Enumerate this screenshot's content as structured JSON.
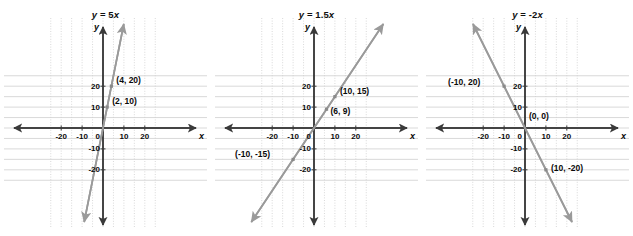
{
  "figure": {
    "title": "",
    "panel_count": 3,
    "axis_names": {
      "x": "x",
      "y": "y"
    },
    "xticks": [
      -20,
      -10,
      0,
      10,
      20
    ],
    "yticks": [
      20,
      10,
      0,
      -10,
      -20
    ],
    "xtick_labels": [
      "-20",
      "-10",
      "0",
      "10",
      "20"
    ],
    "ytick_labels": [
      "20",
      "10",
      "-10",
      "-20"
    ],
    "origin_label": "0",
    "grid_step": 5,
    "grid_color": "#cfcfcf",
    "axis_color": "#3a3a3a",
    "line_color": "#9a9a9a",
    "text_color": "#0a0a0a"
  },
  "chart_data": [
    {
      "type": "line",
      "title": "y = 5x",
      "equation_lhs": "y",
      "equation_rhs": "5x",
      "slope": 5,
      "intercept": 0,
      "xlabel": "x",
      "ylabel": "y",
      "xlim": [
        -25,
        25
      ],
      "ylim": [
        -25,
        25
      ],
      "grid": true,
      "points": [
        {
          "label": "(4, 20)",
          "x": 4,
          "y": 20
        },
        {
          "label": "(2, 10)",
          "x": 2,
          "y": 10
        }
      ]
    },
    {
      "type": "line",
      "title": "y = 1.5x",
      "equation_lhs": "y",
      "equation_rhs": "1.5x",
      "slope": 1.5,
      "intercept": 0,
      "xlabel": "x",
      "ylabel": "y",
      "xlim": [
        -25,
        25
      ],
      "ylim": [
        -25,
        25
      ],
      "grid": true,
      "points": [
        {
          "label": "(10, 15)",
          "x": 10,
          "y": 15
        },
        {
          "label": "(6, 9)",
          "x": 6,
          "y": 9
        },
        {
          "label": "(-10, -15)",
          "x": -10,
          "y": -15
        }
      ]
    },
    {
      "type": "line",
      "title": "y = -2x",
      "equation_lhs": "y",
      "equation_rhs": "-2x",
      "slope": -2,
      "intercept": 0,
      "xlabel": "x",
      "ylabel": "y",
      "xlim": [
        -25,
        25
      ],
      "ylim": [
        -25,
        25
      ],
      "grid": true,
      "points": [
        {
          "label": "(-10, 20)",
          "x": -10,
          "y": 20
        },
        {
          "label": "(0, 0)",
          "x": 0,
          "y": 0
        },
        {
          "label": "(10, -20)",
          "x": 10,
          "y": -20
        }
      ]
    }
  ]
}
